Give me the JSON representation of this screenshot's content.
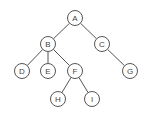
{
  "diagram": {
    "type": "binary-tree",
    "nodes": [
      {
        "id": "A",
        "label": "A",
        "x": 75,
        "y": 18
      },
      {
        "id": "B",
        "label": "B",
        "x": 48,
        "y": 44
      },
      {
        "id": "C",
        "label": "C",
        "x": 102,
        "y": 44
      },
      {
        "id": "D",
        "label": "D",
        "x": 22,
        "y": 71
      },
      {
        "id": "E",
        "label": "E",
        "x": 48,
        "y": 71
      },
      {
        "id": "F",
        "label": "F",
        "x": 75,
        "y": 71
      },
      {
        "id": "G",
        "label": "G",
        "x": 130,
        "y": 71
      },
      {
        "id": "H",
        "label": "H",
        "x": 58,
        "y": 99
      },
      {
        "id": "I",
        "label": "I",
        "x": 92,
        "y": 99
      }
    ],
    "edges": [
      {
        "from": "A",
        "to": "B"
      },
      {
        "from": "A",
        "to": "C"
      },
      {
        "from": "B",
        "to": "D"
      },
      {
        "from": "B",
        "to": "E"
      },
      {
        "from": "B",
        "to": "F"
      },
      {
        "from": "C",
        "to": "G"
      },
      {
        "from": "F",
        "to": "H"
      },
      {
        "from": "F",
        "to": "I"
      }
    ],
    "node_radius": 7.5,
    "colors": {
      "stroke": "#555555",
      "fill": "#ffffff",
      "text": "#444444"
    }
  }
}
